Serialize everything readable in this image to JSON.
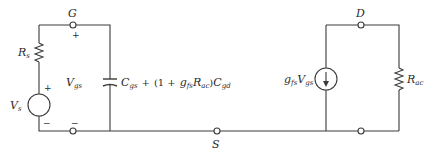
{
  "diagram": {
    "nodes": {
      "gate": "G",
      "drain": "D",
      "source": "S"
    },
    "source_resistor": {
      "symbol": "R",
      "sub": "s"
    },
    "voltage_source": {
      "symbol": "V",
      "sub": "s",
      "plus": "+",
      "minus": "−"
    },
    "gate_voltage": {
      "symbol": "V",
      "sub": "gs",
      "plus": "+",
      "minus": "−"
    },
    "capacitance": {
      "c1": "C",
      "c1_sub": "gs",
      "plus": "+",
      "open": "(1 +",
      "g": "g",
      "g_sub": "fs",
      "r": "R",
      "r_sub": "ac",
      "close": ")",
      "c2": "C",
      "c2_sub": "gd"
    },
    "current_source": {
      "g": "g",
      "g_sub": "fs",
      "v": "V",
      "v_sub": "gs"
    },
    "load_resistor": {
      "symbol": "R",
      "sub": "ac"
    }
  }
}
